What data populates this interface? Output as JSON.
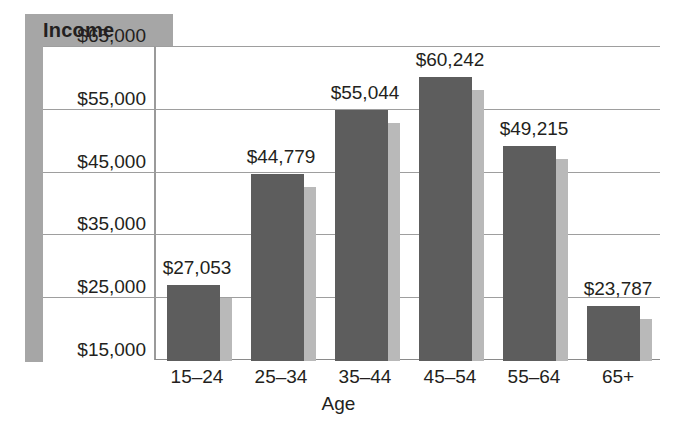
{
  "chart_data": {
    "type": "bar",
    "title": "",
    "xlabel": "Age",
    "ylabel": "Income",
    "categories": [
      "15–24",
      "25–34",
      "35–44",
      "45–54",
      "55–64",
      "65+"
    ],
    "values": [
      27053,
      44779,
      55044,
      60242,
      49215,
      23787
    ],
    "value_labels": [
      "$27,053",
      "$44,779",
      "$55,044",
      "$60,242",
      "$49,215",
      "$23,787"
    ],
    "ytick_labels": [
      "$65,000",
      "$55,000",
      "$45,000",
      "$35,000",
      "$25,000",
      "$15,000"
    ],
    "yticks": [
      65000,
      55000,
      45000,
      35000,
      25000,
      15000
    ],
    "ylim": [
      15000,
      65000
    ],
    "grid": true,
    "legend": "none",
    "series": [
      {
        "name": "Income",
        "values": [
          27053,
          44779,
          55044,
          60242,
          49215,
          23787
        ]
      }
    ],
    "colors": {
      "bar_front": "#5d5d5d",
      "bar_shadow": "#b9b9b9",
      "gridline": "#9e9e9e",
      "band": "#a6a6a6",
      "text": "#231f20",
      "background": "#ffffff"
    }
  },
  "axis_title": {
    "income_label": "Income",
    "age_label": "Age"
  },
  "caption": {
    "text": ""
  }
}
